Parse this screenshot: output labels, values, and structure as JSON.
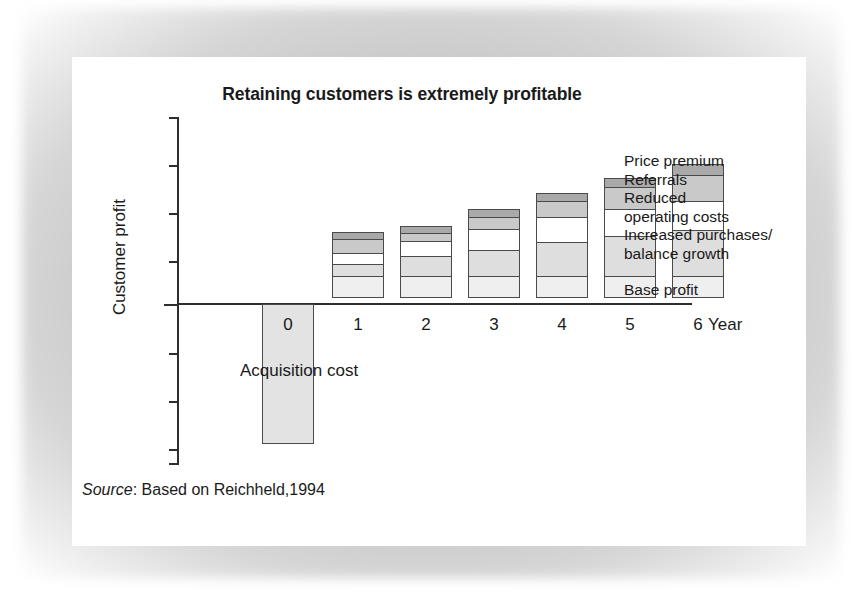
{
  "figure": {
    "title": "Retaining customers is extremely profitable",
    "y_axis_label": "Customer profit",
    "x_axis_title": "Year",
    "annotation": "Acquisition cost",
    "source_word": "Source",
    "source_text": ":  Based on Reichheld,1994"
  },
  "legend": {
    "entries": [
      {
        "label": "Price premium",
        "color": "#a9a9a9"
      },
      {
        "label": "Referrals",
        "color": "#c9c9c9"
      },
      {
        "label": "Reduced",
        "color": "#ffffff"
      },
      {
        "label": "operating costs",
        "color": "#ffffff"
      },
      {
        "label": "Increased purchases/",
        "color": "#dedede"
      },
      {
        "label": "balance growth",
        "color": "#dedede"
      },
      {
        "label": "Base profit",
        "color": "#efefef"
      }
    ]
  },
  "chart_data": {
    "type": "bar",
    "subtype": "stacked-bar",
    "title": "Retaining customers is extremely profitable",
    "xlabel": "Year",
    "ylabel": "Customer profit",
    "grid": false,
    "legend_position": "right",
    "axis_tick_labels": false,
    "categories": [
      "0",
      "1",
      "2",
      "3",
      "4",
      "5",
      "6"
    ],
    "series": [
      {
        "name": "Base profit",
        "color": "#efefef",
        "values": [
          0,
          22,
          22,
          22,
          22,
          22,
          22
        ]
      },
      {
        "name": "Increased purchases/balance growth",
        "color": "#dedede",
        "values": [
          0,
          14,
          22,
          28,
          36,
          42,
          48
        ]
      },
      {
        "name": "Reduced operating costs",
        "color": "#ffffff",
        "values": [
          0,
          12,
          16,
          22,
          26,
          28,
          30
        ]
      },
      {
        "name": "Referrals",
        "color": "#c9c9c9",
        "values": [
          0,
          16,
          10,
          14,
          18,
          24,
          28
        ]
      },
      {
        "name": "Price premium",
        "color": "#a9a9a9",
        "values": [
          0,
          8,
          8,
          9,
          9,
          10,
          12
        ]
      },
      {
        "name": "Acquisition cost",
        "color": "#e3e3e3",
        "values": [
          -140,
          0,
          0,
          0,
          0,
          0,
          0
        ]
      }
    ],
    "totals_above_zero": [
      0,
      72,
      78,
      95,
      111,
      126,
      140
    ],
    "ylim": [
      -160,
      200
    ],
    "zero_line": true,
    "annotations": [
      {
        "text": "Acquisition cost",
        "x": "0",
        "note": "label beside the negative year-0 bar"
      }
    ],
    "source": "Source: Based on Reichheld,1994"
  },
  "bars": [
    {
      "year": "0",
      "left": 85,
      "width": 52,
      "negative": true,
      "height": 140,
      "color": "#e3e3e3"
    },
    {
      "year": "1",
      "left": 155,
      "width": 52,
      "segments": [
        {
          "name": "price-premium",
          "h": 8,
          "color": "#a9a9a9"
        },
        {
          "name": "referrals",
          "h": 16,
          "color": "#c9c9c9"
        },
        {
          "name": "reduced-op-costs",
          "h": 12,
          "color": "#ffffff"
        },
        {
          "name": "increased-purchases",
          "h": 14,
          "color": "#dedede"
        },
        {
          "name": "base-profit",
          "h": 22,
          "color": "#efefef"
        }
      ]
    },
    {
      "year": "2",
      "left": 223,
      "width": 52,
      "segments": [
        {
          "name": "price-premium",
          "h": 8,
          "color": "#a9a9a9"
        },
        {
          "name": "referrals",
          "h": 10,
          "color": "#c9c9c9"
        },
        {
          "name": "reduced-op-costs",
          "h": 16,
          "color": "#ffffff"
        },
        {
          "name": "increased-purchases",
          "h": 22,
          "color": "#dedede"
        },
        {
          "name": "base-profit",
          "h": 22,
          "color": "#efefef"
        }
      ]
    },
    {
      "year": "3",
      "left": 291,
      "width": 52,
      "segments": [
        {
          "name": "price-premium",
          "h": 9,
          "color": "#a9a9a9"
        },
        {
          "name": "referrals",
          "h": 14,
          "color": "#c9c9c9"
        },
        {
          "name": "reduced-op-costs",
          "h": 22,
          "color": "#ffffff"
        },
        {
          "name": "increased-purchases",
          "h": 28,
          "color": "#dedede"
        },
        {
          "name": "base-profit",
          "h": 22,
          "color": "#efefef"
        }
      ]
    },
    {
      "year": "4",
      "left": 359,
      "width": 52,
      "segments": [
        {
          "name": "price-premium",
          "h": 9,
          "color": "#a9a9a9"
        },
        {
          "name": "referrals",
          "h": 18,
          "color": "#c9c9c9"
        },
        {
          "name": "reduced-op-costs",
          "h": 26,
          "color": "#ffffff"
        },
        {
          "name": "increased-purchases",
          "h": 36,
          "color": "#dedede"
        },
        {
          "name": "base-profit",
          "h": 22,
          "color": "#efefef"
        }
      ]
    },
    {
      "year": "5",
      "left": 427,
      "width": 52,
      "segments": [
        {
          "name": "price-premium",
          "h": 10,
          "color": "#a9a9a9"
        },
        {
          "name": "referrals",
          "h": 24,
          "color": "#c9c9c9"
        },
        {
          "name": "reduced-op-costs",
          "h": 28,
          "color": "#ffffff"
        },
        {
          "name": "increased-purchases",
          "h": 42,
          "color": "#dedede"
        },
        {
          "name": "base-profit",
          "h": 22,
          "color": "#efefef"
        }
      ]
    },
    {
      "year": "6",
      "left": 495,
      "width": 52,
      "is_legend_key": true,
      "segments": [
        {
          "name": "price-premium",
          "h": 12,
          "color": "#a9a9a9"
        },
        {
          "name": "referrals",
          "h": 28,
          "color": "#c9c9c9"
        },
        {
          "name": "reduced-op-costs",
          "h": 30,
          "color": "#ffffff"
        },
        {
          "name": "increased-purchases",
          "h": 48,
          "color": "#dedede"
        },
        {
          "name": "base-profit",
          "h": 22,
          "color": "#efefef"
        }
      ]
    }
  ],
  "y_ticks": [
    {
      "y": 60,
      "zero": false,
      "cap": true
    },
    {
      "y": 108,
      "zero": false,
      "cap": false
    },
    {
      "y": 156,
      "zero": false,
      "cap": false
    },
    {
      "y": 204,
      "zero": false,
      "cap": false
    },
    {
      "y": 247,
      "zero": true,
      "cap": false
    },
    {
      "y": 296,
      "zero": false,
      "cap": false
    },
    {
      "y": 344,
      "zero": false,
      "cap": false
    },
    {
      "y": 392,
      "zero": false,
      "cap": false
    },
    {
      "y": 406,
      "zero": false,
      "cap": true
    }
  ]
}
